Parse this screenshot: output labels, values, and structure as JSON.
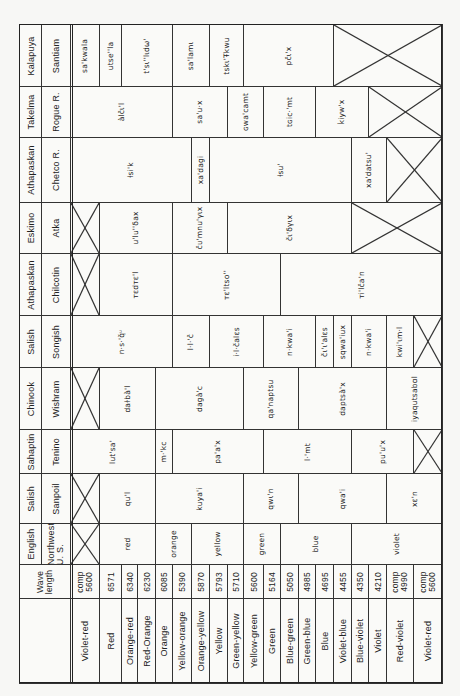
{
  "orientation": "rotated-90-ccw",
  "row_edges_x": [
    19,
    70,
    99,
    121,
    137,
    155,
    172,
    191,
    209,
    227,
    243,
    263,
    280,
    298,
    315,
    333,
    351,
    368,
    386,
    413,
    442
  ],
  "header": {
    "wave_length_label": "Wave\nlength"
  },
  "colors": [
    {
      "name": "Violet-red",
      "wave": "comp\n5600"
    },
    {
      "name": "Red",
      "wave": "6571"
    },
    {
      "name": "Orange-red",
      "wave": "6340"
    },
    {
      "name": "Red-Orange",
      "wave": "6230"
    },
    {
      "name": "Orange",
      "wave": "6085"
    },
    {
      "name": "Yellow-orange",
      "wave": "5390"
    },
    {
      "name": "Orange-yellow",
      "wave": "5870"
    },
    {
      "name": "Yellow",
      "wave": "5793"
    },
    {
      "name": "Green-yellow",
      "wave": "5710"
    },
    {
      "name": "Yellow-green",
      "wave": "5600"
    },
    {
      "name": "Green",
      "wave": "5164"
    },
    {
      "name": "Blue-green",
      "wave": "5050"
    },
    {
      "name": "Green-blue",
      "wave": "4985"
    },
    {
      "name": "Blue",
      "wave": "4695"
    },
    {
      "name": "Violet-blue",
      "wave": "4455"
    },
    {
      "name": "Blue-violet",
      "wave": "4350"
    },
    {
      "name": "Violet",
      "wave": "4210"
    },
    {
      "name": "Red-violet",
      "wave": "comp\n4990"
    },
    {
      "name": "Violet-red",
      "wave": "comp\n5600"
    }
  ],
  "languages": [
    {
      "family": "Kalapuya",
      "name": "Santiam",
      "y": [
        24,
        86
      ],
      "cells": [
        {
          "from": 0,
          "to": 1,
          "word": "sa'kwala"
        },
        {
          "from": 1,
          "to": 2,
          "word": "utse''la"
        },
        {
          "from": 2,
          "to": 5,
          "word": "t'sɩ''lɩdω'"
        },
        {
          "from": 5,
          "to": 7,
          "word": "sa'lamɩ"
        },
        {
          "from": 7,
          "to": 9,
          "word": "tskɩ'Ŧkwu"
        },
        {
          "from": 9,
          "to": 14,
          "word": "pčɩ'x"
        },
        {
          "from": 14,
          "to": 19,
          "word": null
        }
      ]
    },
    {
      "family": "Takelma",
      "name": "Rogue R.",
      "y": [
        86,
        137
      ],
      "cells": [
        {
          "from": 0,
          "to": 5,
          "word": "àlčɩ'l"
        },
        {
          "from": 5,
          "to": 8,
          "word": "sa'u·x"
        },
        {
          "from": 8,
          "to": 10,
          "word": "ɢwa'camt"
        },
        {
          "from": 10,
          "to": 13,
          "word": "tɢic·'mt"
        },
        {
          "from": 13,
          "to": 16,
          "word": "k̇iyw'x"
        },
        {
          "from": 16,
          "to": 19,
          "word": null
        }
      ]
    },
    {
      "family": "Athapaskan",
      "name": "Chetco R.",
      "y": [
        137,
        202
      ],
      "cells": [
        {
          "from": 0,
          "to": 6,
          "word": "ƚsi'k"
        },
        {
          "from": 6,
          "to": 7,
          "word": "xa'dagi"
        },
        {
          "from": 7,
          "to": 15,
          "word": "ƚsu'"
        },
        {
          "from": 15,
          "to": 17,
          "word": "xa'datsu'"
        },
        {
          "from": 17,
          "to": 19,
          "word": null
        }
      ]
    },
    {
      "family": "Eskimo",
      "name": "Atka",
      "y": [
        202,
        253
      ],
      "cells": [
        {
          "from": 0,
          "to": 1,
          "word": null
        },
        {
          "from": 1,
          "to": 5,
          "word": "u'lu''δax"
        },
        {
          "from": 5,
          "to": 8,
          "word": "čᴜ'mnu'γɩx"
        },
        {
          "from": 8,
          "to": 15,
          "word": "čɩ'δγɩx"
        },
        {
          "from": 15,
          "to": 19,
          "word": null
        }
      ]
    },
    {
      "family": "Athapaskan",
      "name": "Chilcotin",
      "y": [
        253,
        315
      ],
      "cells": [
        {
          "from": 0,
          "to": 1,
          "word": null
        },
        {
          "from": 1,
          "to": 5,
          "word": "ᴛɛdᴛɛ'l"
        },
        {
          "from": 5,
          "to": 11,
          "word": "ᴛɛ'ltso''"
        },
        {
          "from": 11,
          "to": 19,
          "word": "ᴛi'lča'n"
        }
      ]
    },
    {
      "family": "Salish",
      "name": "Songish",
      "y": [
        315,
        367
      ],
      "cells": [
        {
          "from": 0,
          "to": 5,
          "word": "n·s·'q̌ᵘ"
        },
        {
          "from": 5,
          "to": 7,
          "word": "l·l·'č"
        },
        {
          "from": 7,
          "to": 10,
          "word": "i·l·čalɛs"
        },
        {
          "from": 10,
          "to": 13,
          "word": "n·kwa'i"
        },
        {
          "from": 13,
          "to": 14,
          "word": "čɩ'ɩ'alɛs"
        },
        {
          "from": 14,
          "to": 15,
          "word": "sqwa'iux"
        },
        {
          "from": 15,
          "to": 17,
          "word": "n·kwa'i"
        },
        {
          "from": 17,
          "to": 18,
          "word": "kwi'ɩm·l"
        },
        {
          "from": 18,
          "to": 19,
          "word": null
        }
      ]
    },
    {
      "family": "Chinook",
      "name": "Wishram",
      "y": [
        367,
        429
      ],
      "cells": [
        {
          "from": 0,
          "to": 1,
          "word": null
        },
        {
          "from": 1,
          "to": 4,
          "word": "daɫbà'l"
        },
        {
          "from": 4,
          "to": 9,
          "word": "dagà'c"
        },
        {
          "from": 9,
          "to": 12,
          "word": "qa'naptsu"
        },
        {
          "from": 12,
          "to": 17,
          "word": "daptsà'x"
        },
        {
          "from": 17,
          "to": 19,
          "word": "iyaqutsabɑl"
        }
      ]
    },
    {
      "family": "Sahaptin",
      "name": "Tenino",
      "y": [
        429,
        473
      ],
      "cells": [
        {
          "from": 0,
          "to": 4,
          "word": "lut'sa'"
        },
        {
          "from": 4,
          "to": 5,
          "word": "m·'kc"
        },
        {
          "from": 5,
          "to": 10,
          "word": "pa'a'x"
        },
        {
          "from": 10,
          "to": 15,
          "word": "l·'mt"
        },
        {
          "from": 15,
          "to": 18,
          "word": "pu'u'x"
        },
        {
          "from": 18,
          "to": 19,
          "word": null
        }
      ]
    },
    {
      "family": "Salish",
      "name": "Sanpoil",
      "y": [
        473,
        523
      ],
      "cells": [
        {
          "from": 0,
          "to": 1,
          "word": null
        },
        {
          "from": 1,
          "to": 4,
          "word": "qu'l"
        },
        {
          "from": 4,
          "to": 9,
          "word": "kuya'i"
        },
        {
          "from": 9,
          "to": 12,
          "word": "qwɩ'n"
        },
        {
          "from": 12,
          "to": 17,
          "word": "qwa'i"
        },
        {
          "from": 17,
          "to": 19,
          "word": "xɛ'n"
        }
      ]
    },
    {
      "family": "English",
      "name": "Northwest\nU. S.",
      "y": [
        523,
        564
      ],
      "cells": [
        {
          "from": 0,
          "to": 1,
          "word": null
        },
        {
          "from": 1,
          "to": 4,
          "word": "red"
        },
        {
          "from": 4,
          "to": 6,
          "word": "orange"
        },
        {
          "from": 6,
          "to": 9,
          "word": "yellow"
        },
        {
          "from": 9,
          "to": 11,
          "word": "green"
        },
        {
          "from": 11,
          "to": 15,
          "word": "blue"
        },
        {
          "from": 15,
          "to": 19,
          "word": "violet"
        }
      ]
    }
  ],
  "bands": {
    "wave_y": [
      564,
      598
    ],
    "color_y": [
      598,
      683
    ],
    "family_x": [
      19,
      41
    ],
    "name_x": [
      41,
      70
    ]
  }
}
